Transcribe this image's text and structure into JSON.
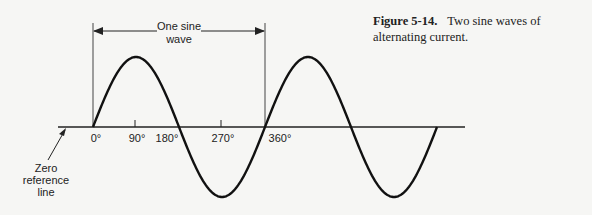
{
  "caption": {
    "figure_number": "Figure 5-14.",
    "text": "Two sine waves of alternating current."
  },
  "labels": {
    "one_sine_line1": "One sine",
    "one_sine_line2": "wave",
    "zero_ref_line1": "Zero",
    "zero_ref_line2": "reference",
    "zero_ref_line3": "line"
  },
  "axis_ticks": [
    {
      "label": "0°",
      "x": 93
    },
    {
      "label": "90°",
      "x": 135
    },
    {
      "label": "180°",
      "x": 179
    },
    {
      "label": "270°",
      "x": 221
    },
    {
      "label": "360°",
      "x": 265
    }
  ],
  "waveform": {
    "cycles": 2,
    "start_x": 93,
    "period_px": 172,
    "amplitude_px": 70,
    "baseline_y": 127,
    "axis_start_x": 58,
    "axis_end_x": 465,
    "line_color": "#111111"
  }
}
